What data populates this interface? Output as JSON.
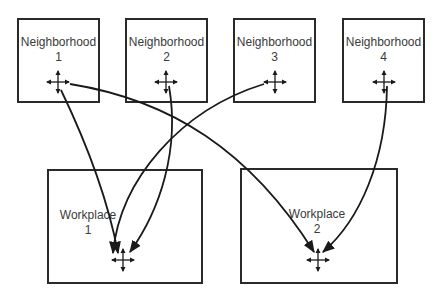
{
  "diagram": {
    "type": "flow",
    "neighborhoods": [
      {
        "id": "n1",
        "name": "Neighborhood",
        "number": "1"
      },
      {
        "id": "n2",
        "name": "Neighborhood",
        "number": "2"
      },
      {
        "id": "n3",
        "name": "Neighborhood",
        "number": "3"
      },
      {
        "id": "n4",
        "name": "Neighborhood",
        "number": "4"
      }
    ],
    "workplaces": [
      {
        "id": "w1",
        "name": "Workplace",
        "number": "1"
      },
      {
        "id": "w2",
        "name": "Workplace",
        "number": "2"
      }
    ],
    "connections": [
      {
        "from": "Neighborhood 1",
        "to": "Workplace 1"
      },
      {
        "from": "Neighborhood 1",
        "to": "Workplace 2"
      },
      {
        "from": "Neighborhood 2",
        "to": "Workplace 1"
      },
      {
        "from": "Neighborhood 3",
        "to": "Workplace 1"
      },
      {
        "from": "Neighborhood 4",
        "to": "Workplace 2"
      }
    ],
    "node_icon": "four-way-arrow-crosshair-icon",
    "colors": {
      "stroke": "#1a1a1a",
      "text": "#3a3a3a",
      "background": "#ffffff"
    }
  }
}
